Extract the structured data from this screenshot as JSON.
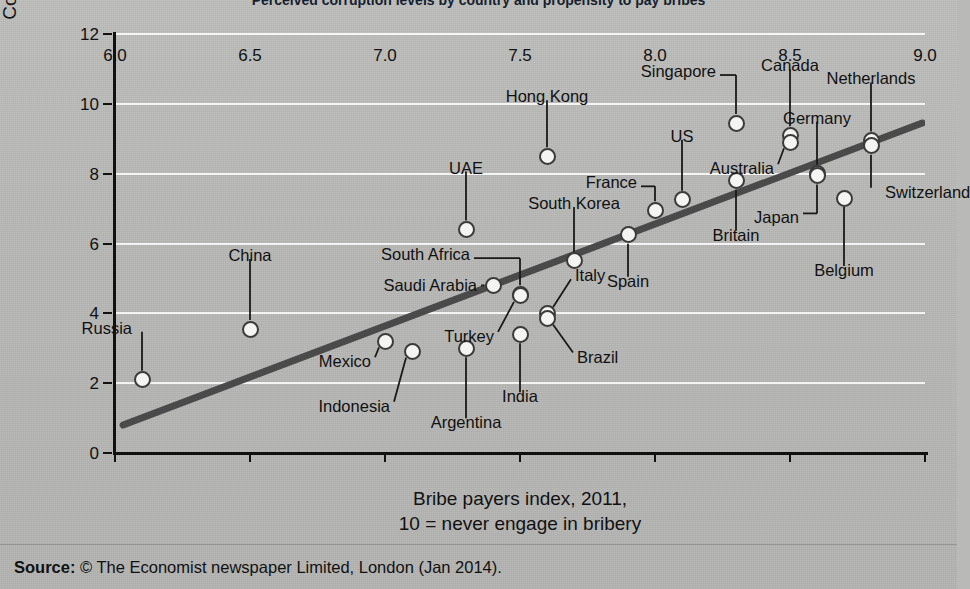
{
  "title": "Perceived corruption levels by country and propensity to pay bribes",
  "source": {
    "label": "Source:",
    "text": "© The Economist newspaper Limited, London (Jan 2014)."
  },
  "axes": {
    "y": {
      "title_line1": "Corruption perceptions index, 2011,",
      "title_line2": "10 = least corrupt",
      "min": 0,
      "max": 12,
      "ticks": [
        "0",
        "2",
        "4",
        "6",
        "8",
        "10",
        "12"
      ],
      "tick_values": [
        0,
        2,
        4,
        6,
        8,
        10,
        12
      ]
    },
    "x": {
      "title_line1": "Bribe payers index, 2011,",
      "title_line2": "10 = never engage in bribery",
      "min": 6.0,
      "max": 9.0,
      "ticks": [
        "6.0",
        "6.5",
        "7.0",
        "7.5",
        "8.0",
        "8.5",
        "9.0"
      ],
      "tick_values": [
        6.0,
        6.5,
        7.0,
        7.5,
        8.0,
        8.5,
        9.0
      ]
    }
  },
  "colors": {
    "background": "#b9b9b7",
    "plot_background": "#b5b5b3",
    "gridline": "#ffffff",
    "axis": "#111111",
    "marker_fill": "#f4f4f2",
    "marker_stroke": "#3b3b3b",
    "trendline": "#4a4a4a"
  },
  "chart_data": {
    "type": "scatter",
    "title": "Perceived corruption levels by country and propensity to pay bribes",
    "xlabel": "Bribe payers index, 2011, 10 = never engage in bribery",
    "ylabel": "Corruption perceptions index, 2011, 10 = least corrupt",
    "xlim": [
      6.0,
      9.0
    ],
    "ylim": [
      0,
      12
    ],
    "grid": "horizontal",
    "legend": "none",
    "trendline": {
      "type": "linear",
      "x_start": 6.03,
      "y_start": 0.8,
      "x_end": 8.99,
      "y_end": 9.45
    },
    "points": [
      {
        "label": "Russia",
        "x": 6.1,
        "y": 2.1,
        "label_dx": -10,
        "label_dy": -52,
        "label_align": "r",
        "leader": "v",
        "leader_len": 36
      },
      {
        "label": "China",
        "x": 6.5,
        "y": 3.55,
        "label_dx": 0,
        "label_dy": -74,
        "label_align": "c",
        "leader": "v",
        "leader_len": 58
      },
      {
        "label": "Mexico",
        "x": 7.0,
        "y": 3.2,
        "label_dx": -14,
        "label_dy": 20,
        "label_align": "r",
        "leader": "diag",
        "leader_len": 20
      },
      {
        "label": "Indonesia",
        "x": 7.1,
        "y": 2.9,
        "label_dx": -22,
        "label_dy": 54,
        "label_align": "r",
        "leader": "diag",
        "leader_len": 48
      },
      {
        "label": "Argentina",
        "x": 7.3,
        "y": 3.0,
        "label_dx": 0,
        "label_dy": 74,
        "label_align": "c",
        "leader": "v",
        "leader_len": 56
      },
      {
        "label": "UAE",
        "x": 7.3,
        "y": 6.4,
        "label_dx": 0,
        "label_dy": -62,
        "label_align": "c",
        "leader": "v",
        "leader_len": 44
      },
      {
        "label": "Saudi Arabia",
        "x": 7.4,
        "y": 4.8,
        "label_dx": -16,
        "label_dy": 0,
        "label_align": "r",
        "leader": "h",
        "leader_len": 14
      },
      {
        "label": "South Africa",
        "x": 7.5,
        "y": 4.55,
        "label_dx": -50,
        "label_dy": -40,
        "label_align": "r",
        "leader": "elbow",
        "leader_len": 30
      },
      {
        "label": "Turkey",
        "x": 7.5,
        "y": 4.5,
        "label_dx": -26,
        "label_dy": 40,
        "label_align": "r",
        "leader": "diag",
        "leader_len": 34
      },
      {
        "label": "India",
        "x": 7.5,
        "y": 3.4,
        "label_dx": 0,
        "label_dy": 62,
        "label_align": "c",
        "leader": "v",
        "leader_len": 44
      },
      {
        "label": "Italy",
        "x": 7.6,
        "y": 4.0,
        "label_dx": 28,
        "label_dy": -38,
        "label_align": "l",
        "leader": "diag",
        "leader_len": 28
      },
      {
        "label": "Brazil",
        "x": 7.6,
        "y": 3.85,
        "label_dx": 30,
        "label_dy": 38,
        "label_align": "l",
        "leader": "diag",
        "leader_len": 30
      },
      {
        "label": "Hong Kong",
        "x": 7.6,
        "y": 8.5,
        "label_dx": 0,
        "label_dy": -60,
        "label_align": "c",
        "leader": "v",
        "leader_len": 42
      },
      {
        "label": "South Korea",
        "x": 7.7,
        "y": 5.5,
        "label_dx": 0,
        "label_dy": -58,
        "label_align": "c",
        "leader": "v",
        "leader_len": 42
      },
      {
        "label": "Spain",
        "x": 7.9,
        "y": 6.25,
        "label_dx": 0,
        "label_dy": 46,
        "label_align": "c",
        "leader": "v",
        "leader_len": 30
      },
      {
        "label": "France",
        "x": 8.0,
        "y": 6.95,
        "label_dx": -18,
        "label_dy": -28,
        "label_align": "r",
        "leader": "elbow",
        "leader_len": 22
      },
      {
        "label": "US",
        "x": 8.1,
        "y": 7.25,
        "label_dx": 0,
        "label_dy": -64,
        "label_align": "c",
        "leader": "v",
        "leader_len": 48
      },
      {
        "label": "Singapore",
        "x": 8.3,
        "y": 9.45,
        "label_dx": -20,
        "label_dy": -52,
        "label_align": "r",
        "leader": "elbow",
        "leader_len": 42
      },
      {
        "label": "Britain",
        "x": 8.3,
        "y": 7.8,
        "label_dx": 0,
        "label_dy": 54,
        "label_align": "c",
        "leader": "v",
        "leader_len": 38
      },
      {
        "label": "Canada",
        "x": 8.5,
        "y": 9.1,
        "label_dx": 0,
        "label_dy": -70,
        "label_align": "c",
        "leader": "v",
        "leader_len": 52
      },
      {
        "label": "Australia",
        "x": 8.5,
        "y": 8.9,
        "label_dx": -16,
        "label_dy": 26,
        "label_align": "r",
        "leader": "diag",
        "leader_len": 20
      },
      {
        "label": "Germany",
        "x": 8.6,
        "y": 8.0,
        "label_dx": 0,
        "label_dy": -56,
        "label_align": "c",
        "leader": "v",
        "leader_len": 40
      },
      {
        "label": "Japan",
        "x": 8.6,
        "y": 7.95,
        "label_dx": -18,
        "label_dy": 42,
        "label_align": "r",
        "leader": "elbow",
        "leader_len": 34
      },
      {
        "label": "Belgium",
        "x": 8.7,
        "y": 7.3,
        "label_dx": 0,
        "label_dy": 72,
        "label_align": "c",
        "leader": "v",
        "leader_len": 54
      },
      {
        "label": "Netherlands",
        "x": 8.8,
        "y": 8.95,
        "label_dx": 0,
        "label_dy": -62,
        "label_align": "c",
        "leader": "v",
        "leader_len": 46
      },
      {
        "label": "Switzerland",
        "x": 8.8,
        "y": 8.8,
        "label_dx": 14,
        "label_dy": 46,
        "label_align": "l",
        "leader": "v",
        "leader_len": 34
      }
    ]
  }
}
